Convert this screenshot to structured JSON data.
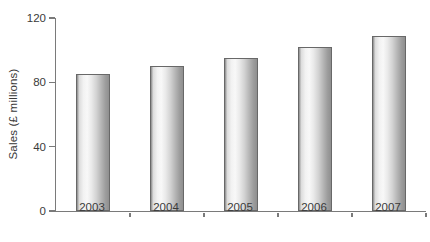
{
  "chart_data": {
    "type": "bar",
    "title": "",
    "xlabel": "",
    "ylabel": "Sales (£ millions)",
    "categories": [
      "2003",
      "2004",
      "2005",
      "2006",
      "2007"
    ],
    "values": [
      85,
      90,
      95,
      102,
      109
    ],
    "ylim": [
      0,
      120
    ],
    "yticks": [
      0,
      40,
      80,
      120
    ],
    "grid": false,
    "legend": "none",
    "colors": {
      "background": "#ffffff",
      "axis": "#7a7a7a",
      "text": "#3a3a3a",
      "bar_light": "#f8f8f8",
      "bar_dark": "#8a8a8a",
      "bar_outline": "#686868"
    }
  }
}
